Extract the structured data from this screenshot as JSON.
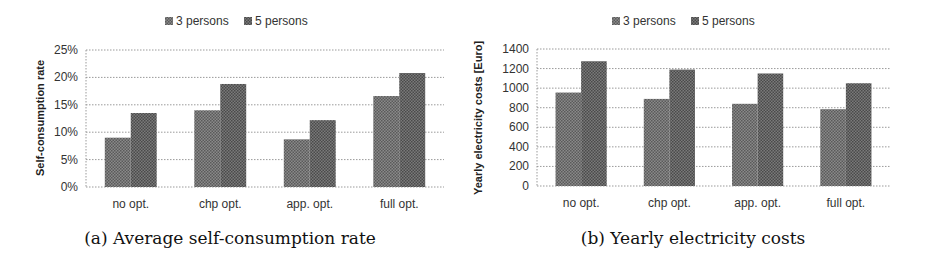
{
  "chart_data": [
    {
      "type": "bar",
      "caption": "(a) Average self-consumption rate",
      "title": "",
      "xlabel": "",
      "ylabel": "Self-consumption rate",
      "categories": [
        "no opt.",
        "chp opt.",
        "app. opt.",
        "full opt."
      ],
      "series": [
        {
          "name": "3 persons",
          "values": [
            9.0,
            14.0,
            8.7,
            16.6
          ]
        },
        {
          "name": "5 persons",
          "values": [
            13.5,
            18.8,
            12.2,
            20.8
          ]
        }
      ],
      "ylim": [
        0,
        25
      ],
      "yticks": [
        0,
        5,
        10,
        15,
        20,
        25
      ],
      "ytick_labels": [
        "0%",
        "5%",
        "10%",
        "15%",
        "20%",
        "25%"
      ],
      "unit": "%",
      "grid": true,
      "legend": "top-center"
    },
    {
      "type": "bar",
      "caption": "(b) Yearly electricity costs",
      "title": "",
      "xlabel": "",
      "ylabel": "Yearly electricity costs [Euro]",
      "categories": [
        "no opt.",
        "chp opt.",
        "app. opt.",
        "full opt."
      ],
      "series": [
        {
          "name": "3 persons",
          "values": [
            955,
            890,
            840,
            785
          ]
        },
        {
          "name": "5 persons",
          "values": [
            1275,
            1190,
            1150,
            1050
          ]
        }
      ],
      "ylim": [
        0,
        1400
      ],
      "yticks": [
        0,
        200,
        400,
        600,
        800,
        1000,
        1200,
        1400
      ],
      "ytick_labels": [
        "0",
        "200",
        "400",
        "600",
        "800",
        "1000",
        "1200",
        "1400"
      ],
      "unit": "Euro",
      "grid": true,
      "legend": "top-center"
    }
  ],
  "colors": {
    "series_3_persons": "#7d7d7d",
    "series_5_persons": "#6a6a6a",
    "grid": "#9a9a9a",
    "text": "#333333"
  }
}
